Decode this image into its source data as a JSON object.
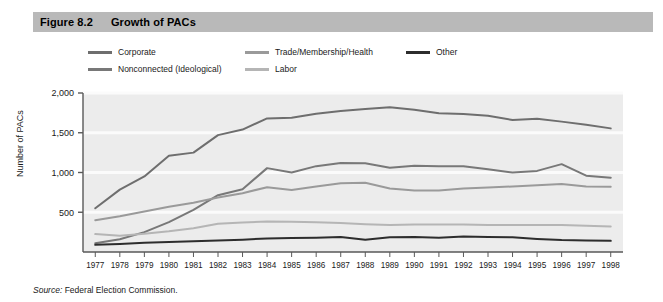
{
  "header": {
    "figure_number": "Figure 8.2",
    "title": "Growth of PACs",
    "band_color": "#b9b9b9"
  },
  "source": {
    "label": "Source:",
    "text": "Federal Election Commission."
  },
  "legend": {
    "position": "top",
    "items": [
      {
        "label": "Corporate",
        "color": "#6e6e6e"
      },
      {
        "label": "Nonconnected (Ideological)",
        "color": "#787878"
      },
      {
        "label": "Trade/Membership/Health",
        "color": "#9a9a9a"
      },
      {
        "label": "Labor",
        "color": "#b5b5b5"
      },
      {
        "label": "Other",
        "color": "#2d2d2d"
      }
    ]
  },
  "chart_data": {
    "type": "line",
    "title": "Growth of PACs",
    "xlabel": "",
    "ylabel": "Number of PACs",
    "ylim": [
      0,
      2000
    ],
    "yticks": [
      500,
      1000,
      1500,
      2000
    ],
    "ytick_labels": [
      "500",
      "1,000",
      "1,500",
      "2,000"
    ],
    "grid": true,
    "plot_background": "#ececec",
    "gridline_color": "#fbfbfb",
    "axis_color": "#595959",
    "x": [
      1977,
      1978,
      1979,
      1980,
      1981,
      1982,
      1983,
      1984,
      1985,
      1986,
      1987,
      1988,
      1989,
      1990,
      1991,
      1992,
      1993,
      1994,
      1995,
      1996,
      1997,
      1998
    ],
    "xtick_labels": [
      "1977",
      "1978",
      "1979",
      "1980",
      "1981",
      "1982",
      "1983",
      "1984",
      "1985",
      "1986",
      "1987",
      "1988",
      "1989",
      "1990",
      "1991",
      "1992",
      "1993",
      "1994",
      "1995",
      "1996",
      "1997",
      "1998"
    ],
    "series": [
      {
        "name": "Corporate",
        "color": "#6e6e6e",
        "values": [
          550,
          785,
          950,
          1210,
          1250,
          1470,
          1540,
          1680,
          1690,
          1740,
          1775,
          1800,
          1820,
          1790,
          1745,
          1735,
          1715,
          1660,
          1675,
          1640,
          1600,
          1555
        ]
      },
      {
        "name": "Nonconnected (Ideological)",
        "color": "#787878",
        "values": [
          110,
          160,
          250,
          375,
          530,
          715,
          790,
          1055,
          1000,
          1080,
          1120,
          1115,
          1060,
          1085,
          1080,
          1080,
          1040,
          1000,
          1020,
          1105,
          960,
          935
        ]
      },
      {
        "name": "Trade/Membership/Health",
        "color": "#9a9a9a",
        "values": [
          400,
          450,
          510,
          570,
          620,
          685,
          740,
          815,
          780,
          825,
          865,
          870,
          800,
          775,
          775,
          800,
          810,
          825,
          840,
          855,
          825,
          820
        ]
      },
      {
        "name": "Labor",
        "color": "#b5b5b5",
        "values": [
          225,
          205,
          230,
          260,
          300,
          355,
          370,
          385,
          380,
          375,
          365,
          350,
          340,
          345,
          345,
          345,
          340,
          340,
          340,
          340,
          330,
          320
        ]
      },
      {
        "name": "Other",
        "color": "#2d2d2d",
        "values": [
          90,
          100,
          115,
          125,
          135,
          145,
          155,
          170,
          175,
          180,
          190,
          155,
          185,
          190,
          180,
          195,
          190,
          185,
          165,
          150,
          145,
          140
        ]
      }
    ]
  }
}
